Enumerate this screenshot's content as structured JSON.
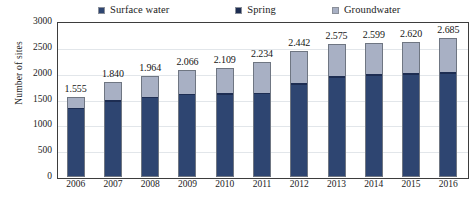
{
  "chart": {
    "type": "bar",
    "y_axis_title": "Number of sites"
  },
  "legend": {
    "position": "top",
    "items": [
      {
        "label": "Surface water",
        "swatch": "legend-swatch-surface-water",
        "color": "#2e4571"
      },
      {
        "label": "Spring",
        "swatch": "legend-swatch-spring",
        "color": "#1d2d52"
      },
      {
        "label": "Groundwater",
        "swatch": "legend-swatch-groundwater",
        "color": "#a8b0c4"
      }
    ]
  },
  "y_ticks": [
    "3000",
    "2500",
    "2000",
    "1500",
    "1000",
    "500",
    "0"
  ],
  "x_ticks": [
    "2006",
    "2007",
    "2008",
    "2009",
    "2010",
    "2011",
    "2012",
    "2013",
    "2014",
    "2015",
    "2016"
  ],
  "bar_labels": [
    "1.555",
    "1.840",
    "1.964",
    "2.066",
    "2.109",
    "2.234",
    "2.442",
    "2.575",
    "2.599",
    "2.620",
    "2.685"
  ],
  "chart_data": {
    "type": "bar",
    "subtype": "stacked-column",
    "title": "",
    "xlabel": "",
    "ylabel": "Number of sites",
    "ylim": [
      0,
      3000
    ],
    "ytick_step": 500,
    "grid": true,
    "legend_position": "top",
    "categories": [
      "2006",
      "2007",
      "2008",
      "2009",
      "2010",
      "2011",
      "2012",
      "2013",
      "2014",
      "2015",
      "2016"
    ],
    "totals": [
      1555,
      1840,
      1964,
      2066,
      2109,
      2234,
      2442,
      2575,
      2599,
      2620,
      2685
    ],
    "total_labels": [
      "1.555",
      "1.840",
      "1.964",
      "2.066",
      "2.109",
      "2.234",
      "2.442",
      "2.575",
      "2.599",
      "2.620",
      "2.685"
    ],
    "series": [
      {
        "name": "Surface water",
        "color": "#2e4571",
        "values": [
          1330,
          1470,
          1540,
          1590,
          1600,
          1610,
          1790,
          1930,
          1960,
          1980,
          2000
        ]
      },
      {
        "name": "Spring",
        "color": "#1d2d52",
        "values": [
          24,
          26,
          28,
          30,
          31,
          32,
          34,
          36,
          37,
          38,
          40
        ]
      },
      {
        "name": "Groundwater",
        "color": "#a8b0c4",
        "values": [
          201,
          344,
          396,
          446,
          478,
          592,
          618,
          609,
          602,
          602,
          645
        ]
      }
    ],
    "annotations": [
      "Data labels above each column show the total number of sites using a decimal point as the thousands separator."
    ]
  }
}
